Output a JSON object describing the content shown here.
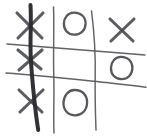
{
  "board": {
    "title": "Tic-Tac-Toe",
    "background_color": "#ffffff",
    "ink_color": "#55565a",
    "mark_color": "#4a4b4f",
    "win_line_color": "#2a2b2e",
    "style": "hand-drawn pencil sketch",
    "rows": 3,
    "columns": 3,
    "cells": [
      {
        "row": 0,
        "col": 0,
        "mark": "X",
        "label": "top-left"
      },
      {
        "row": 0,
        "col": 1,
        "mark": "O",
        "label": "top-center"
      },
      {
        "row": 0,
        "col": 2,
        "mark": "X",
        "label": "top-right"
      },
      {
        "row": 1,
        "col": 0,
        "mark": "X",
        "label": "middle-left"
      },
      {
        "row": 1,
        "col": 1,
        "mark": "",
        "label": "middle-center"
      },
      {
        "row": 1,
        "col": 2,
        "mark": "O",
        "label": "middle-right"
      },
      {
        "row": 2,
        "col": 0,
        "mark": "X",
        "label": "bottom-left"
      },
      {
        "row": 2,
        "col": 1,
        "mark": "O",
        "label": "bottom-center"
      },
      {
        "row": 2,
        "col": 2,
        "mark": "",
        "label": "bottom-right"
      }
    ],
    "result": {
      "winner": "X",
      "winning_line": "left-column",
      "winning_cells": [
        0,
        3,
        6
      ],
      "struck_through": true
    }
  }
}
